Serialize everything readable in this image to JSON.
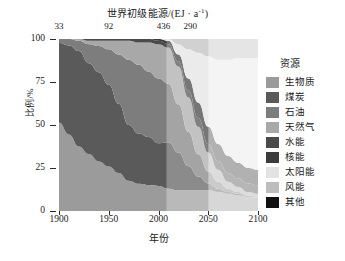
{
  "chart_data": {
    "type": "area",
    "xlabel": "年份",
    "ylabel": "比例/%",
    "xlim": [
      1900,
      2100
    ],
    "ylim": [
      0,
      100
    ],
    "grid": false,
    "legend_position": "right",
    "legend_title": "资源",
    "x_ticks": [
      "1900",
      "1950",
      "2000",
      "2050",
      "2100"
    ],
    "x_tick_values": [
      1900,
      1950,
      2000,
      2050,
      2100
    ],
    "y_ticks": [
      "0",
      "25",
      "50",
      "75",
      "100"
    ],
    "y_tick_values": [
      0,
      25,
      50,
      75,
      100
    ],
    "top_axis_label": "世界初级能源/(EJ · a⁻¹)",
    "top_annotations": [
      {
        "label": "33",
        "year": 1900
      },
      {
        "label": "92",
        "year": 1950
      },
      {
        "label": "436",
        "year": 2005
      },
      {
        "label": "290",
        "year": 2032
      }
    ],
    "shaded_bands": [
      {
        "from": 1900,
        "to": 2008,
        "shade": "#ffffff",
        "opacity": 0
      },
      {
        "from": 2008,
        "to": 2050,
        "shade": "#ffffff",
        "opacity": 0.3
      },
      {
        "from": 2050,
        "to": 2100,
        "shade": "#ffffff",
        "opacity": 0.6
      }
    ],
    "x": [
      1900,
      1910,
      1920,
      1930,
      1940,
      1950,
      1960,
      1970,
      1980,
      1990,
      2000,
      2010,
      2020,
      2030,
      2040,
      2050,
      2060,
      2070,
      2080,
      2090,
      2100
    ],
    "series": [
      {
        "name": "生物质",
        "color": "#9b9b9b",
        "values": [
          52,
          44,
          38,
          33,
          29,
          26,
          22,
          18,
          16,
          15,
          14,
          13,
          12,
          12,
          12,
          12,
          11,
          10,
          9,
          8,
          8
        ]
      },
      {
        "name": "煤炭",
        "color": "#5a5a5a",
        "values": [
          46,
          52,
          55,
          53,
          52,
          47,
          40,
          32,
          29,
          28,
          26,
          27,
          22,
          14,
          8,
          4,
          2,
          1,
          1,
          0,
          0
        ]
      },
      {
        "name": "石油",
        "color": "#7d7d7d",
        "values": [
          2,
          4,
          6,
          11,
          15,
          21,
          29,
          38,
          40,
          38,
          37,
          34,
          28,
          20,
          13,
          7,
          4,
          2,
          1,
          1,
          0
        ]
      },
      {
        "name": "天然气",
        "color": "#a8a8a8",
        "values": [
          0,
          0,
          1,
          2,
          3,
          5,
          8,
          11,
          13,
          17,
          20,
          21,
          22,
          20,
          16,
          11,
          7,
          4,
          3,
          2,
          2
        ]
      },
      {
        "name": "水能",
        "color": "#4a4a4a",
        "values": [
          0,
          0,
          0,
          1,
          1,
          1,
          1,
          1,
          2,
          2,
          2,
          2,
          3,
          4,
          5,
          5,
          5,
          5,
          5,
          5,
          5
        ]
      },
      {
        "name": "核能",
        "color": "#3c3c3c",
        "values": [
          0,
          0,
          0,
          0,
          0,
          0,
          0,
          0,
          0,
          0,
          1,
          2,
          4,
          7,
          9,
          10,
          10,
          10,
          9,
          9,
          9
        ]
      },
      {
        "name": "太阳能",
        "color": "#e3e3e3",
        "values": [
          0,
          0,
          0,
          0,
          0,
          0,
          0,
          0,
          0,
          0,
          0,
          1,
          6,
          17,
          29,
          41,
          49,
          56,
          61,
          64,
          65
        ]
      },
      {
        "name": "风能",
        "color": "#bdbdbd",
        "values": [
          0,
          0,
          0,
          0,
          0,
          0,
          0,
          0,
          0,
          0,
          0,
          0,
          3,
          6,
          8,
          10,
          12,
          12,
          11,
          11,
          11
        ]
      },
      {
        "name": "其他",
        "color": "#111111",
        "values": [
          0,
          0,
          0,
          0,
          0,
          0,
          0,
          0,
          0,
          0,
          0,
          0,
          0,
          0,
          0,
          0,
          0,
          0,
          0,
          0,
          0
        ]
      }
    ]
  },
  "legend": {
    "title": "资源",
    "items": [
      {
        "label": "生物质",
        "color": "#9b9b9b"
      },
      {
        "label": "煤炭",
        "color": "#5a5a5a"
      },
      {
        "label": "石油",
        "color": "#7d7d7d"
      },
      {
        "label": "天然气",
        "color": "#a8a8a8"
      },
      {
        "label": "水能",
        "color": "#4a4a4a"
      },
      {
        "label": "核能",
        "color": "#3c3c3c"
      },
      {
        "label": "太阳能",
        "color": "#e3e3e3"
      },
      {
        "label": "风能",
        "color": "#bdbdbd"
      },
      {
        "label": "其他",
        "color": "#111111"
      }
    ]
  }
}
